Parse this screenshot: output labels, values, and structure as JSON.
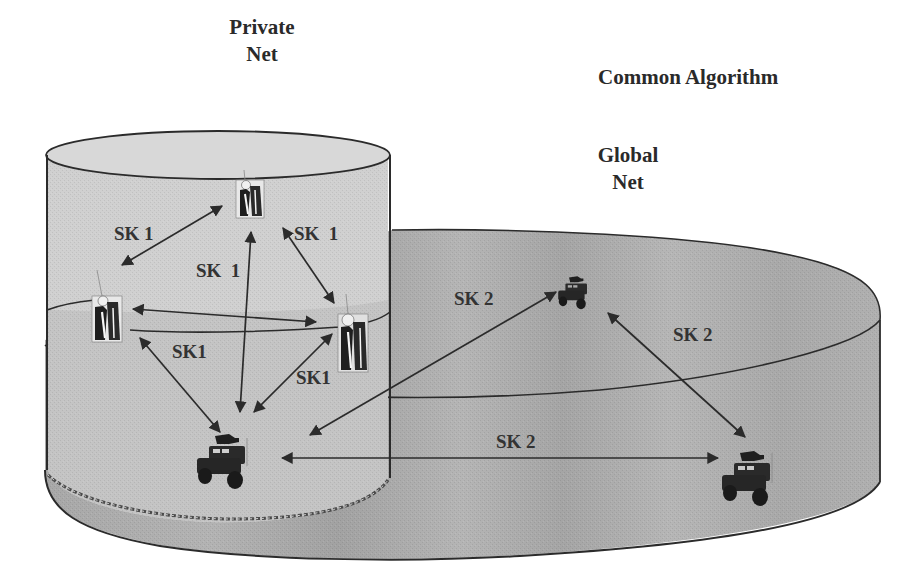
{
  "titles": {
    "private_net": [
      "Private",
      "Net"
    ],
    "common_algorithm": "Common Algorithm",
    "global_net": [
      "Global",
      "Net"
    ]
  },
  "colors": {
    "private_cylinder_top": "#d6d6d6",
    "private_cylinder_body": "#cfcfcf",
    "global_cylinder_body": "#a9a9a9",
    "global_cylinder_light": "#b8b8b8",
    "outline": "#2b2b2b",
    "arrow": "#2b2b2b",
    "text": "#333333"
  },
  "nodes": [
    {
      "id": "soldier-top",
      "type": "soldier",
      "net": "private"
    },
    {
      "id": "soldier-left",
      "type": "soldier",
      "net": "private"
    },
    {
      "id": "soldier-right",
      "type": "soldier",
      "net": "private"
    },
    {
      "id": "vehicle-private",
      "type": "vehicle",
      "net": "private+global"
    },
    {
      "id": "vehicle-global-top",
      "type": "vehicle",
      "net": "global"
    },
    {
      "id": "vehicle-global-right",
      "type": "vehicle",
      "net": "global"
    }
  ],
  "links": [
    {
      "label": "SK 1",
      "from": "soldier-top",
      "to": "soldier-left"
    },
    {
      "label": "SK  1",
      "from": "soldier-top",
      "to": "soldier-right"
    },
    {
      "label": "SK  1",
      "from": "soldier-top",
      "to": "vehicle-private"
    },
    {
      "label": "",
      "from": "soldier-left",
      "to": "soldier-right"
    },
    {
      "label": "SK1",
      "from": "soldier-left",
      "to": "vehicle-private"
    },
    {
      "label": "SK1",
      "from": "soldier-right",
      "to": "vehicle-private"
    },
    {
      "label": "SK 2",
      "from": "vehicle-private",
      "to": "vehicle-global-top"
    },
    {
      "label": "SK 2",
      "from": "vehicle-global-top",
      "to": "vehicle-global-right"
    },
    {
      "label": "SK 2",
      "from": "vehicle-private",
      "to": "vehicle-global-right"
    }
  ]
}
